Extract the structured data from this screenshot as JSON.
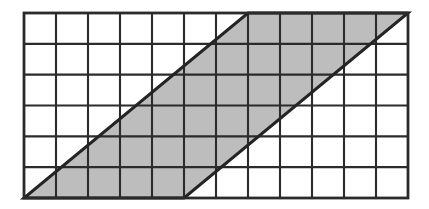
{
  "figure": {
    "type": "geometry-diagram",
    "background_color": "#ffffff",
    "canvas": {
      "width": 429,
      "height": 209
    }
  },
  "grid": {
    "columns": 12,
    "rows": 6,
    "origin_x": 24,
    "origin_y": 13,
    "cell_width": 32,
    "cell_height": 30.8333,
    "line_color": "#2b2b2b",
    "inner_line_width": 2.1,
    "border_line_width": 2.8,
    "cell_fill_color": "#ffffff"
  },
  "shaded_region": {
    "name": "parallelogram",
    "fill_color": "#bdbdbd",
    "outline_color": "#242424",
    "outline_width": 3.0,
    "vertices_grid": [
      {
        "col": 0,
        "row": 6
      },
      {
        "col": 5,
        "row": 6
      },
      {
        "col": 12,
        "row": 0
      },
      {
        "col": 7,
        "row": 0
      }
    ],
    "base_cells": 5,
    "height_cells": 6,
    "slant_run_cells": 7,
    "area_cells": 30
  },
  "edges": [
    {
      "name": "bottom-edge",
      "from_col": 0,
      "from_row": 6,
      "to_col": 5,
      "to_row": 6
    },
    {
      "name": "left-diagonal",
      "from_col": 0,
      "from_row": 6,
      "to_col": 7,
      "to_row": 0
    },
    {
      "name": "top-edge",
      "from_col": 7,
      "from_row": 0,
      "to_col": 12,
      "to_row": 0
    },
    {
      "name": "right-diagonal",
      "from_col": 5,
      "from_row": 6,
      "to_col": 12,
      "to_row": 0
    }
  ]
}
